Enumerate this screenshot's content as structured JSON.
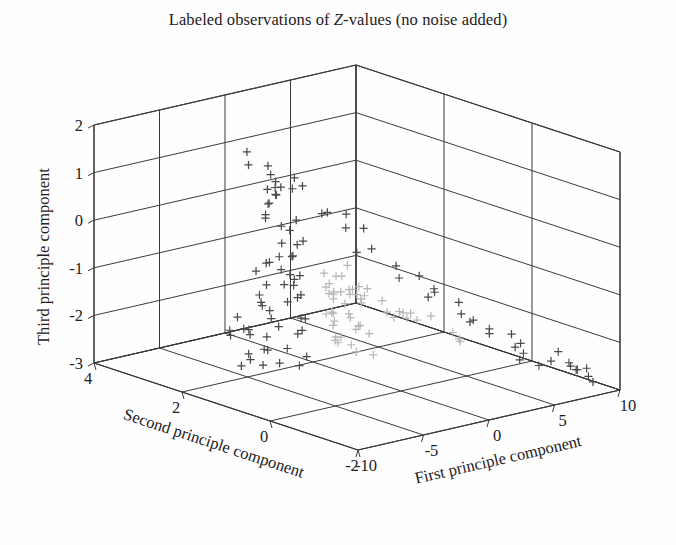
{
  "figure": {
    "title_part1": "Labeled observations of ",
    "title_italic": "Z",
    "title_part2": "-values (no noise added)",
    "background_color": "#fefefe",
    "frame_color": "#3a3a3a",
    "bottom_artifact": ""
  },
  "axes": {
    "x": {
      "label": "First principle component",
      "ticks": [
        "-10",
        "-5",
        "0",
        "5",
        "10"
      ],
      "values": [
        -10,
        -5,
        0,
        5,
        10
      ],
      "range": [
        -10,
        10
      ]
    },
    "y": {
      "label": "Second principle component",
      "ticks": [
        "4",
        "2",
        "0",
        "-2"
      ],
      "values": [
        4,
        2,
        0,
        -2
      ],
      "range": [
        -2,
        4
      ]
    },
    "z": {
      "label": "Third principle component",
      "ticks": [
        "2",
        "1",
        "0",
        "-1",
        "-2",
        "-3"
      ],
      "values": [
        2,
        1,
        0,
        -1,
        -2,
        -3
      ],
      "range": [
        -3,
        2
      ]
    }
  },
  "chart_data": {
    "type": "scatter",
    "title": "Labeled observations of Z-values (no noise added)",
    "xlabel": "First principle component",
    "ylabel": "Second principle component",
    "zlabel": "Third principle component",
    "xlim": [
      -10,
      10
    ],
    "ylim": [
      -2,
      4
    ],
    "zlim": [
      -3,
      2
    ],
    "grid": true,
    "legend": "none",
    "marker": "plus",
    "projection": "3d",
    "series": [
      {
        "name": "dark-group",
        "color": "#4a4a4a",
        "points": [
          [
            -8.9,
            1.1,
            -2.0
          ],
          [
            -8.4,
            0.9,
            -2.1
          ],
          [
            -8.1,
            1.4,
            -1.8
          ],
          [
            -7.8,
            0.7,
            -2.2
          ],
          [
            -7.5,
            1.2,
            -1.6
          ],
          [
            -7.2,
            0.5,
            -2.3
          ],
          [
            -7.0,
            1.6,
            -1.5
          ],
          [
            -6.8,
            0.9,
            -1.9
          ],
          [
            -6.5,
            1.3,
            -1.7
          ],
          [
            -6.3,
            0.6,
            -2.1
          ],
          [
            -6.0,
            1.0,
            -1.6
          ],
          [
            -5.8,
            1.5,
            -1.4
          ],
          [
            -5.5,
            0.8,
            -1.8
          ],
          [
            -5.3,
            1.2,
            -1.5
          ],
          [
            -5.0,
            1.7,
            -1.3
          ],
          [
            -4.8,
            0.9,
            -1.7
          ],
          [
            -4.5,
            1.4,
            -1.2
          ],
          [
            -4.2,
            1.1,
            -1.5
          ],
          [
            -4.0,
            1.6,
            -1.1
          ],
          [
            -3.7,
            1.3,
            -1.3
          ],
          [
            -3.4,
            1.8,
            -1.0
          ],
          [
            -3.1,
            1.5,
            -1.2
          ],
          [
            -2.8,
            2.0,
            -0.8
          ],
          [
            -2.5,
            1.7,
            -1.0
          ],
          [
            -2.2,
            2.2,
            -0.6
          ],
          [
            -1.9,
            1.9,
            -0.8
          ],
          [
            -1.6,
            2.4,
            -0.4
          ],
          [
            -1.3,
            2.1,
            -0.6
          ],
          [
            -1.0,
            2.6,
            -0.2
          ],
          [
            -0.8,
            2.3,
            -0.4
          ],
          [
            -0.5,
            2.8,
            0.1
          ],
          [
            -0.3,
            2.5,
            -0.1
          ],
          [
            0.0,
            3.0,
            0.3
          ],
          [
            0.2,
            2.7,
            0.1
          ],
          [
            0.4,
            3.2,
            0.5
          ],
          [
            0.6,
            2.9,
            0.3
          ],
          [
            0.8,
            3.4,
            0.6
          ],
          [
            1.0,
            3.1,
            0.4
          ],
          [
            1.2,
            3.5,
            0.7
          ],
          [
            1.4,
            3.2,
            0.5
          ],
          [
            1.6,
            3.0,
            0.4
          ],
          [
            1.9,
            2.8,
            0.2
          ],
          [
            2.2,
            2.5,
            0.0
          ],
          [
            2.5,
            2.2,
            -0.2
          ],
          [
            2.8,
            2.0,
            -0.4
          ],
          [
            3.1,
            1.7,
            -0.6
          ],
          [
            3.4,
            1.5,
            -0.8
          ],
          [
            3.7,
            1.2,
            -1.0
          ],
          [
            4.0,
            1.0,
            -1.2
          ],
          [
            4.3,
            0.7,
            -1.4
          ],
          [
            4.6,
            0.5,
            -1.6
          ],
          [
            4.9,
            0.2,
            -1.7
          ],
          [
            5.2,
            0.0,
            -1.9
          ],
          [
            5.5,
            -0.2,
            -2.0
          ],
          [
            5.8,
            -0.5,
            -2.1
          ],
          [
            6.1,
            -0.7,
            -2.2
          ],
          [
            6.4,
            -0.9,
            -2.3
          ],
          [
            6.7,
            -1.1,
            -2.4
          ],
          [
            7.0,
            -1.3,
            -2.4
          ],
          [
            7.3,
            -1.5,
            -2.5
          ],
          [
            7.6,
            -1.6,
            -2.5
          ],
          [
            7.9,
            -1.7,
            -2.6
          ],
          [
            8.2,
            -1.8,
            -2.6
          ]
        ]
      },
      {
        "name": "light-group",
        "color": "#b6b6b6",
        "points": [
          [
            -4.0,
            0.2,
            -1.9
          ],
          [
            -3.6,
            0.4,
            -1.8
          ],
          [
            -3.2,
            0.0,
            -2.0
          ],
          [
            -2.9,
            0.6,
            -1.7
          ],
          [
            -2.6,
            0.3,
            -1.8
          ],
          [
            -2.3,
            0.8,
            -1.6
          ],
          [
            -2.0,
            0.5,
            -1.7
          ],
          [
            -1.7,
            1.0,
            -1.5
          ],
          [
            -1.4,
            0.7,
            -1.6
          ],
          [
            -1.1,
            1.2,
            -1.4
          ],
          [
            -0.8,
            0.9,
            -1.5
          ],
          [
            -0.5,
            1.4,
            -1.3
          ],
          [
            -0.2,
            1.1,
            -1.4
          ],
          [
            0.1,
            1.6,
            -1.2
          ],
          [
            0.4,
            1.3,
            -1.3
          ],
          [
            0.7,
            1.8,
            -1.1
          ],
          [
            1.0,
            1.5,
            -1.2
          ],
          [
            1.3,
            1.2,
            -1.4
          ],
          [
            1.6,
            0.9,
            -1.5
          ],
          [
            1.9,
            0.6,
            -1.6
          ],
          [
            2.2,
            0.4,
            -1.7
          ],
          [
            2.5,
            0.1,
            -1.8
          ],
          [
            2.8,
            -0.1,
            -1.9
          ],
          [
            3.1,
            -0.4,
            -2.0
          ],
          [
            0.0,
            1.0,
            -1.45
          ],
          [
            0.3,
            0.8,
            -1.5
          ],
          [
            -0.3,
            1.2,
            -1.4
          ],
          [
            0.6,
            0.6,
            -1.55
          ],
          [
            -0.6,
            0.4,
            -1.6
          ],
          [
            0.9,
            0.3,
            -1.6
          ],
          [
            -0.9,
            1.5,
            -1.35
          ],
          [
            1.2,
            0.0,
            -1.7
          ]
        ]
      }
    ]
  },
  "geometry": {
    "corner_left": [
      94,
      363
    ],
    "corner_front": [
      358,
      450
    ],
    "corner_right": [
      620,
      390
    ],
    "corner_apex": [
      392,
      47
    ],
    "z_top_left": [
      94,
      125
    ],
    "z_top_right": [
      622,
      152
    ]
  }
}
